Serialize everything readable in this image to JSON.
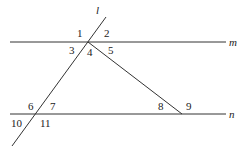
{
  "diagram": {
    "lines": {
      "l": "l",
      "m": "m",
      "n": "n"
    },
    "angles": [
      "1",
      "2",
      "3",
      "4",
      "5",
      "6",
      "7",
      "8",
      "9",
      "10",
      "11"
    ],
    "colors": {
      "stroke": "#333333",
      "text": "#222222"
    }
  }
}
